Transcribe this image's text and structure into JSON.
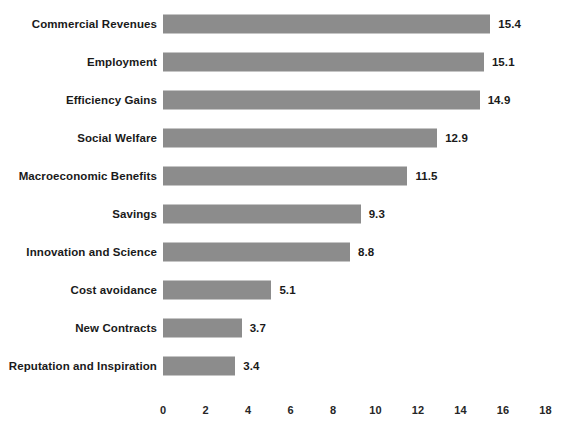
{
  "chart_data": {
    "type": "bar",
    "orientation": "horizontal",
    "title": "",
    "subtitle": "",
    "xlabel": "",
    "ylabel": "",
    "xlim": [
      0,
      18
    ],
    "xticks": [
      0,
      2,
      4,
      6,
      8,
      10,
      12,
      14,
      16,
      18
    ],
    "grid": false,
    "legend": null,
    "legend_position": "none",
    "bar_color": "#8c8c8c",
    "label_color": "#1a1a1a",
    "background": "#ffffff",
    "data_labels_shown": true,
    "categories": [
      "Commercial Revenues",
      "Employment",
      "Efficiency Gains",
      "Social Welfare",
      "Macroeconomic Benefits",
      "Savings",
      "Innovation and Science",
      "Cost avoidance",
      "New Contracts",
      "Reputation and Inspiration"
    ],
    "values": [
      15.4,
      15.1,
      14.9,
      12.9,
      11.5,
      9.3,
      8.8,
      5.1,
      3.7,
      3.4
    ],
    "value_labels": [
      "15.4",
      "15.1",
      "14.9",
      "12.9",
      "11.5",
      "9.3",
      "8.8",
      "5.1",
      "3.7",
      "3.4"
    ],
    "tick_labels": [
      "0",
      "2",
      "4",
      "6",
      "8",
      "10",
      "12",
      "14",
      "16",
      "18"
    ]
  }
}
